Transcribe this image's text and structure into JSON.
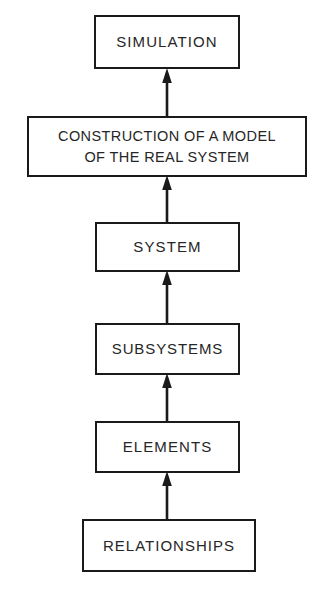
{
  "diagram": {
    "type": "flowchart",
    "orientation": "bottom-to-top",
    "background_color": "#ffffff",
    "line_color": "#1a1a1a",
    "text_color": "#262626",
    "nodes": [
      {
        "id": "simulation",
        "label": "SIMULATION",
        "level": 6
      },
      {
        "id": "construction",
        "label": "CONSTRUCTION OF A MODEL\nOF THE REAL SYSTEM",
        "level": 5
      },
      {
        "id": "system",
        "label": "SYSTEM",
        "level": 4
      },
      {
        "id": "subsystems",
        "label": "SUBSYSTEMS",
        "level": 3
      },
      {
        "id": "elements",
        "label": "ELEMENTS",
        "level": 2
      },
      {
        "id": "relationships",
        "label": "RELATIONSHIPS",
        "level": 1
      }
    ],
    "edges": [
      {
        "id": "e1",
        "from": "relationships",
        "to": "elements",
        "style": "solid-arrow-up"
      },
      {
        "id": "e2",
        "from": "elements",
        "to": "subsystems",
        "style": "solid-arrow-up"
      },
      {
        "id": "e3",
        "from": "subsystems",
        "to": "system",
        "style": "solid-arrow-up"
      },
      {
        "id": "e4",
        "from": "system",
        "to": "construction",
        "style": "solid-arrow-up"
      },
      {
        "id": "e5",
        "from": "construction",
        "to": "simulation",
        "style": "solid-arrow-up"
      }
    ]
  }
}
